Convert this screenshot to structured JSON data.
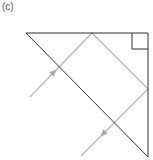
{
  "figure": {
    "panel_label": "(c)",
    "colors": {
      "prism_outline": "#333333",
      "ray": "#b8b8b8",
      "background": "#ffffff"
    },
    "prism": {
      "points": [
        [
          26,
          33
        ],
        [
          148,
          33
        ],
        [
          148,
          157
        ]
      ],
      "right_angle_marker": {
        "x": 132,
        "y": 33,
        "size": 16
      }
    },
    "ray_path": {
      "points": [
        [
          30,
          97
        ],
        [
          92,
          33
        ],
        [
          148,
          89
        ],
        [
          81,
          156
        ]
      ],
      "arrows": [
        {
          "x": 54,
          "y": 72,
          "direction": "up-right"
        },
        {
          "x": 103,
          "y": 134,
          "direction": "down-left"
        }
      ]
    }
  }
}
